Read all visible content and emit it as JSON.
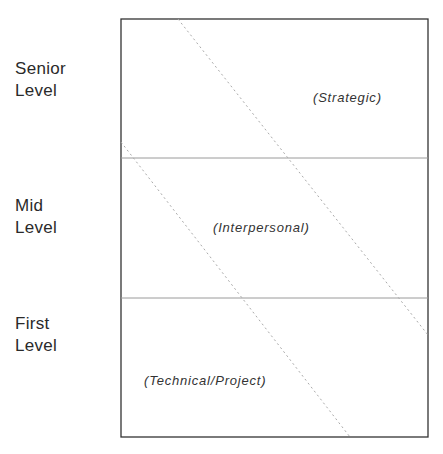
{
  "levels": [
    {
      "line1": "Senior",
      "line2": "Level"
    },
    {
      "line1": "Mid",
      "line2": "Level"
    },
    {
      "line1": "First",
      "line2": "Level"
    }
  ],
  "regions": {
    "strategic": "(Strategic)",
    "interpersonal": "(Interpersonal)",
    "technical": "(Technical/Project)"
  },
  "colors": {
    "frame": "#333333",
    "divider": "#9a9a9a",
    "dotted": "#b0b0b0"
  }
}
